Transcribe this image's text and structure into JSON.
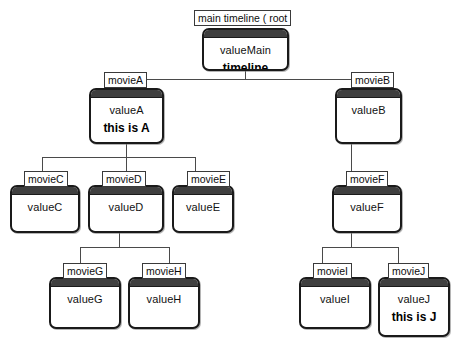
{
  "diagram": {
    "type": "tree",
    "nodes": [
      {
        "id": "root",
        "label": "main timeline (  root",
        "value": "valueMain",
        "note": "timeline",
        "parent": null
      },
      {
        "id": "A",
        "label": "movieA",
        "value": "valueA",
        "note": "this is A",
        "parent": "root"
      },
      {
        "id": "B",
        "label": "movieB",
        "value": "valueB",
        "note": "",
        "parent": "root"
      },
      {
        "id": "C",
        "label": "movieC",
        "value": "valueC",
        "note": "",
        "parent": "A"
      },
      {
        "id": "D",
        "label": "movieD",
        "value": "valueD",
        "note": "",
        "parent": "A"
      },
      {
        "id": "E",
        "label": "movieE",
        "value": "valueE",
        "note": "",
        "parent": "A"
      },
      {
        "id": "F",
        "label": "movieF",
        "value": "valueF",
        "note": "",
        "parent": "B"
      },
      {
        "id": "G",
        "label": "movieG",
        "value": "valueG",
        "note": "",
        "parent": "D"
      },
      {
        "id": "H",
        "label": "movieH",
        "value": "valueH",
        "note": "",
        "parent": "D"
      },
      {
        "id": "I",
        "label": "movieI",
        "value": "valueI",
        "note": "",
        "parent": "F"
      },
      {
        "id": "J",
        "label": "movieJ",
        "value": "valueJ",
        "note": "this is J",
        "parent": "F"
      }
    ],
    "colors": {
      "node_border": "#1a1a1a",
      "node_titlebar": "#3f3f3f",
      "node_fill": "#ffffff",
      "connector": "#4a4a4a",
      "label_border": "#3a3a3a",
      "text": "#111111",
      "background": "#ffffff"
    }
  }
}
